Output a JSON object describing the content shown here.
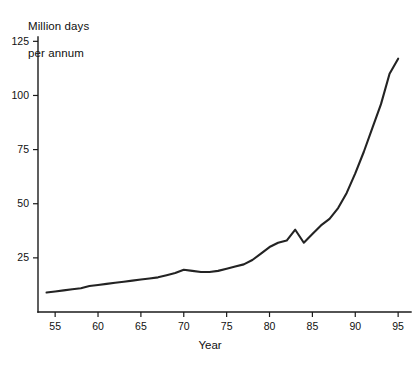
{
  "chart_data": {
    "type": "line",
    "title": "",
    "ylabel": "Million days\nper annum",
    "ylabel_line1": "Million days",
    "ylabel_line2": "per annum",
    "xlabel": "Year",
    "xlim": [
      53.0,
      96.5
    ],
    "ylim": [
      0,
      127
    ],
    "grid": false,
    "legend": null,
    "xticks": [
      55,
      60,
      65,
      70,
      75,
      80,
      85,
      90,
      95
    ],
    "xtick_labels": [
      "55",
      "60",
      "65",
      "70",
      "75",
      "80",
      "85",
      "90",
      "95"
    ],
    "yticks": [
      25,
      50,
      75,
      100,
      125
    ],
    "ytick_labels": [
      "25",
      "50",
      "75",
      "100",
      "125"
    ],
    "series": [
      {
        "name": "Million days per annum",
        "color": "#232323",
        "x": [
          54,
          55,
          56,
          57,
          58,
          59,
          60,
          61,
          62,
          63,
          64,
          65,
          66,
          67,
          68,
          69,
          70,
          71,
          72,
          73,
          74,
          75,
          76,
          77,
          78,
          79,
          80,
          81,
          82,
          83,
          84,
          85,
          86,
          87,
          88,
          89,
          90,
          91,
          92,
          93,
          94,
          95
        ],
        "values": [
          9,
          9.5,
          10,
          10.5,
          11,
          12,
          12.5,
          13,
          13.5,
          14,
          14.5,
          15,
          15.5,
          16,
          17,
          18,
          19.5,
          19,
          18.5,
          18.5,
          19,
          20,
          21,
          22,
          24,
          27,
          30,
          32,
          33,
          38,
          32,
          36,
          40,
          43,
          48,
          55,
          64,
          74,
          85,
          96,
          110,
          117
        ]
      }
    ]
  }
}
